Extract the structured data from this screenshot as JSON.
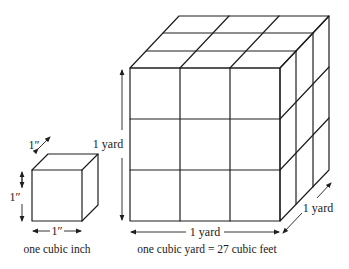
{
  "small_cube": {
    "depth_label": "1″",
    "height_label": "1″",
    "width_label": "1″",
    "caption": "one cubic inch"
  },
  "large_cube": {
    "height_label": "1 yard",
    "width_label": "1 yard",
    "depth_label": "1 yard",
    "caption": "one cubic yard = 27 cubic feet",
    "grid": "3x3x3"
  }
}
